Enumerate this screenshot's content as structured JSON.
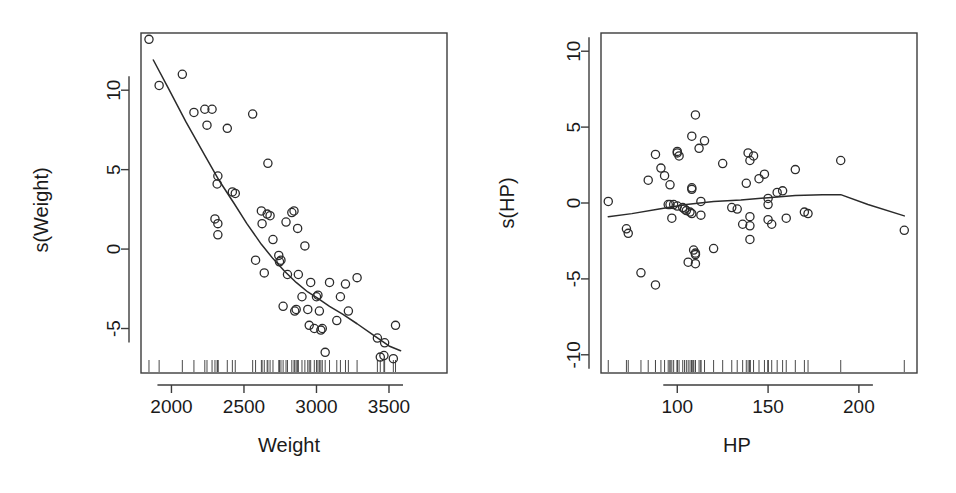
{
  "figure": {
    "background_color": "#ffffff",
    "foreground_color": "#1a1a1a",
    "point_color": "#2b2b2b",
    "curve_color": "#2b2b2b",
    "width": 956,
    "height": 493
  },
  "chart_data": [
    {
      "type": "scatter",
      "id": "weight-panel",
      "title": "",
      "xlabel": "Weight",
      "ylabel": "s(Weight)",
      "xlim": [
        1790,
        3900
      ],
      "ylim": [
        -7.8,
        13.6
      ],
      "xticks": [
        2000,
        2500,
        3000,
        3500
      ],
      "xtick_labels": [
        "2000",
        "2500",
        "3000",
        "3500"
      ],
      "yticks": [
        10,
        5,
        0,
        -5
      ],
      "ytick_labels": [
        "10",
        "5",
        "0",
        "-5"
      ],
      "grid": false,
      "legend": "none",
      "marker": "open-circle",
      "points": [
        [
          1845,
          13.2
        ],
        [
          1915,
          10.3
        ],
        [
          2075,
          11.0
        ],
        [
          2155,
          8.6
        ],
        [
          2230,
          8.8
        ],
        [
          2245,
          7.8
        ],
        [
          2280,
          8.8
        ],
        [
          2300,
          1.9
        ],
        [
          2320,
          1.6
        ],
        [
          2320,
          4.6
        ],
        [
          2315,
          4.1
        ],
        [
          2320,
          0.9
        ],
        [
          2385,
          7.6
        ],
        [
          2420,
          3.6
        ],
        [
          2440,
          3.5
        ],
        [
          2560,
          8.5
        ],
        [
          2580,
          -0.7
        ],
        [
          2620,
          2.4
        ],
        [
          2625,
          1.6
        ],
        [
          2640,
          -1.5
        ],
        [
          2660,
          2.2
        ],
        [
          2665,
          5.4
        ],
        [
          2680,
          2.1
        ],
        [
          2700,
          0.6
        ],
        [
          2740,
          -0.4
        ],
        [
          2745,
          -0.8
        ],
        [
          2755,
          -0.7
        ],
        [
          2770,
          -3.6
        ],
        [
          2790,
          1.7
        ],
        [
          2800,
          -1.6
        ],
        [
          2830,
          2.3
        ],
        [
          2845,
          2.4
        ],
        [
          2850,
          -3.9
        ],
        [
          2860,
          -3.8
        ],
        [
          2870,
          1.3
        ],
        [
          2875,
          -1.6
        ],
        [
          2900,
          -3.0
        ],
        [
          2920,
          0.2
        ],
        [
          2940,
          -3.8
        ],
        [
          2950,
          -4.8
        ],
        [
          2960,
          -2.1
        ],
        [
          2985,
          -5.0
        ],
        [
          3000,
          -3.0
        ],
        [
          3010,
          -2.9
        ],
        [
          3020,
          -3.9
        ],
        [
          3030,
          -5.1
        ],
        [
          3040,
          -5.0
        ],
        [
          3060,
          -6.5
        ],
        [
          3090,
          -2.1
        ],
        [
          3140,
          -4.5
        ],
        [
          3165,
          -3.0
        ],
        [
          3200,
          -2.2
        ],
        [
          3220,
          -3.9
        ],
        [
          3280,
          -1.8
        ],
        [
          3420,
          -5.6
        ],
        [
          3440,
          -6.8
        ],
        [
          3465,
          -6.7
        ],
        [
          3470,
          -5.9
        ],
        [
          3530,
          -6.9
        ],
        [
          3545,
          -4.8
        ]
      ],
      "curve": [
        [
          1875,
          11.9
        ],
        [
          1980,
          10.1
        ],
        [
          2100,
          8.0
        ],
        [
          2230,
          5.9
        ],
        [
          2330,
          4.3
        ],
        [
          2430,
          2.9
        ],
        [
          2520,
          1.6
        ],
        [
          2620,
          0.3
        ],
        [
          2700,
          -0.6
        ],
        [
          2780,
          -1.4
        ],
        [
          2860,
          -2.1
        ],
        [
          2940,
          -2.7
        ],
        [
          3010,
          -3.1
        ],
        [
          3090,
          -3.6
        ],
        [
          3180,
          -4.1
        ],
        [
          3280,
          -4.7
        ],
        [
          3390,
          -5.4
        ],
        [
          3500,
          -6.1
        ],
        [
          3580,
          -6.4
        ]
      ],
      "rug": [
        1845,
        1915,
        2075,
        2155,
        2230,
        2245,
        2280,
        2300,
        2315,
        2320,
        2320,
        2320,
        2385,
        2420,
        2440,
        2560,
        2580,
        2620,
        2625,
        2640,
        2660,
        2665,
        2680,
        2700,
        2740,
        2745,
        2755,
        2770,
        2790,
        2800,
        2830,
        2845,
        2850,
        2860,
        2870,
        2875,
        2900,
        2920,
        2940,
        2950,
        2960,
        2985,
        3000,
        3010,
        3020,
        3030,
        3040,
        3060,
        3090,
        3140,
        3165,
        3200,
        3220,
        3280,
        3420,
        3440,
        3465,
        3470,
        3530,
        3545
      ]
    },
    {
      "type": "scatter",
      "id": "hp-panel",
      "title": "",
      "xlabel": "HP",
      "ylabel": "s(HP)",
      "xlim": [
        58,
        232
      ],
      "ylim": [
        -11.2,
        11.2
      ],
      "xticks": [
        100,
        150,
        200
      ],
      "xtick_labels": [
        "100",
        "150",
        "200"
      ],
      "yticks": [
        10,
        5,
        0,
        -5,
        -10
      ],
      "ytick_labels": [
        "10",
        "5",
        "0",
        "-5",
        "-10"
      ],
      "grid": false,
      "legend": "none",
      "marker": "open-circle",
      "points": [
        [
          62,
          0.1
        ],
        [
          72,
          -1.7
        ],
        [
          73,
          -2.0
        ],
        [
          80,
          -4.6
        ],
        [
          84,
          1.5
        ],
        [
          88,
          3.2
        ],
        [
          88,
          -5.4
        ],
        [
          91,
          2.3
        ],
        [
          93,
          1.8
        ],
        [
          95,
          -0.1
        ],
        [
          96,
          1.2
        ],
        [
          96,
          -0.1
        ],
        [
          97,
          -1.0
        ],
        [
          98,
          -0.1
        ],
        [
          100,
          3.3
        ],
        [
          100,
          3.4
        ],
        [
          100,
          -0.2
        ],
        [
          101,
          3.1
        ],
        [
          103,
          -0.3
        ],
        [
          104,
          -0.4
        ],
        [
          105,
          -0.5
        ],
        [
          106,
          -3.9
        ],
        [
          107,
          -0.6
        ],
        [
          108,
          4.4
        ],
        [
          108,
          0.9
        ],
        [
          108,
          1.0
        ],
        [
          108,
          -0.7
        ],
        [
          109,
          -3.1
        ],
        [
          110,
          -3.3
        ],
        [
          110,
          -3.4
        ],
        [
          110,
          5.8
        ],
        [
          110,
          -4.0
        ],
        [
          112,
          3.6
        ],
        [
          113,
          0.1
        ],
        [
          113,
          -0.8
        ],
        [
          115,
          4.1
        ],
        [
          120,
          -3.0
        ],
        [
          125,
          2.6
        ],
        [
          130,
          -0.3
        ],
        [
          133,
          -0.4
        ],
        [
          136,
          -1.4
        ],
        [
          138,
          1.3
        ],
        [
          139,
          3.3
        ],
        [
          140,
          2.8
        ],
        [
          140,
          -0.9
        ],
        [
          140,
          -1.5
        ],
        [
          140,
          -2.4
        ],
        [
          142,
          3.1
        ],
        [
          145,
          1.6
        ],
        [
          148,
          1.9
        ],
        [
          150,
          0.3
        ],
        [
          150,
          -0.1
        ],
        [
          150,
          -1.1
        ],
        [
          152,
          -1.4
        ],
        [
          155,
          0.7
        ],
        [
          158,
          0.8
        ],
        [
          160,
          -1.0
        ],
        [
          165,
          2.2
        ],
        [
          170,
          -0.6
        ],
        [
          172,
          -0.7
        ],
        [
          190,
          2.8
        ],
        [
          225,
          -1.8
        ]
      ],
      "curve": [
        [
          62,
          -0.9
        ],
        [
          75,
          -0.7
        ],
        [
          90,
          -0.4
        ],
        [
          105,
          -0.1
        ],
        [
          120,
          0.1
        ],
        [
          135,
          0.2
        ],
        [
          150,
          0.35
        ],
        [
          165,
          0.5
        ],
        [
          180,
          0.55
        ],
        [
          190,
          0.55
        ],
        [
          205,
          -0.1
        ],
        [
          225,
          -0.85
        ]
      ],
      "rug": [
        62,
        72,
        73,
        80,
        84,
        88,
        88,
        91,
        93,
        95,
        96,
        96,
        97,
        98,
        100,
        100,
        100,
        101,
        103,
        104,
        105,
        106,
        107,
        108,
        108,
        108,
        108,
        109,
        110,
        110,
        110,
        110,
        112,
        113,
        113,
        115,
        120,
        125,
        130,
        133,
        136,
        138,
        139,
        140,
        140,
        140,
        140,
        142,
        145,
        148,
        150,
        150,
        150,
        152,
        155,
        158,
        160,
        165,
        170,
        172,
        190,
        225
      ]
    }
  ]
}
